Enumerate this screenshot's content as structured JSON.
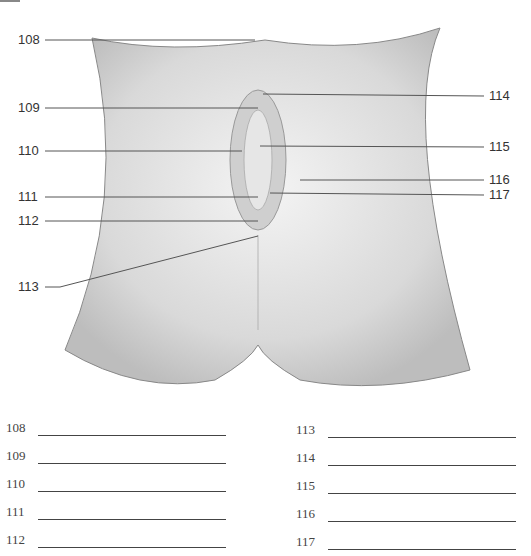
{
  "figure": {
    "callouts": [
      {
        "num": "108",
        "side": "left",
        "y": 40
      },
      {
        "num": "109",
        "side": "left",
        "y": 108
      },
      {
        "num": "110",
        "side": "left",
        "y": 151
      },
      {
        "num": "111",
        "side": "left",
        "y": 197
      },
      {
        "num": "112",
        "side": "left",
        "y": 221
      },
      {
        "num": "113",
        "side": "left",
        "y": 287
      },
      {
        "num": "114",
        "side": "right",
        "y": 96
      },
      {
        "num": "115",
        "side": "right",
        "y": 147
      },
      {
        "num": "116",
        "side": "right",
        "y": 180
      },
      {
        "num": "117",
        "side": "right",
        "y": 195
      }
    ]
  },
  "answer_blanks": {
    "left": [
      "108",
      "109",
      "110",
      "111",
      "112"
    ],
    "right": [
      "113",
      "114",
      "115",
      "116",
      "117"
    ]
  }
}
